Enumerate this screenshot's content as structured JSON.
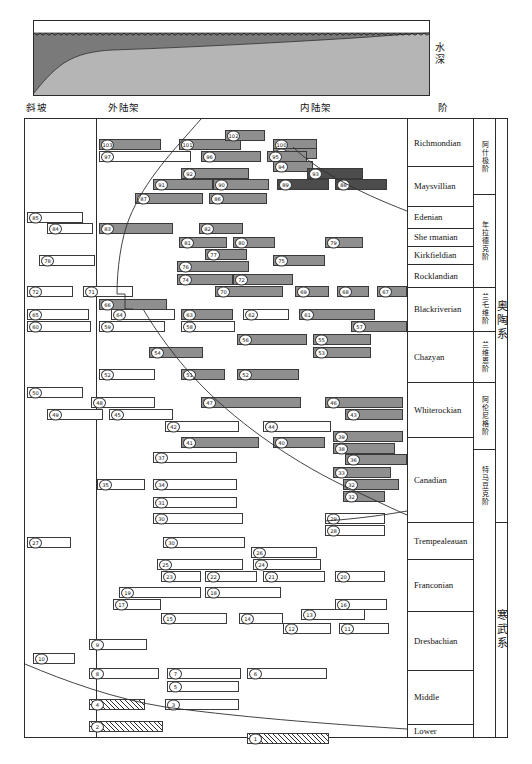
{
  "figure": {
    "title_caption": "",
    "depth_axis_label": "水深",
    "column_headers": [
      {
        "key": "slope",
        "label": "斜坡",
        "x": 26
      },
      {
        "key": "outer_shelf",
        "label": "外陆架",
        "x": 108
      },
      {
        "key": "inner_shelf",
        "label": "内陆架",
        "x": 300
      },
      {
        "key": "stage",
        "label": "阶",
        "x": 438
      }
    ]
  },
  "depth_panel": {
    "water_fill_color": "#7a7a7a",
    "sediment_fill_color": "#b5b5b5",
    "sky_color": "#ffffff",
    "wave_marker": "scalloped-waterline"
  },
  "chart_data": {
    "type": "table",
    "xlabel": "",
    "ylabel": "",
    "facies_columns": [
      "斜坡",
      "外陆架",
      "内陆架"
    ],
    "systems": [
      {
        "name": "奥陶系",
        "top": 0,
        "bottom": 403
      },
      {
        "name": "寒武系",
        "top": 403,
        "bottom": 619
      }
    ],
    "series": [
      {
        "name": "阿什极阶",
        "top": 0,
        "bottom": 75
      },
      {
        "name": "年拉德克阶",
        "top": 75,
        "bottom": 168
      },
      {
        "name": "兰乇维阶",
        "top": 168,
        "bottom": 212
      },
      {
        "name": "兰维恩阶",
        "top": 212,
        "bottom": 263
      },
      {
        "name": "阿伦尼格阶",
        "top": 263,
        "bottom": 330
      },
      {
        "name": "特马豆克阶",
        "top": 330,
        "bottom": 403
      }
    ],
    "stages": [
      {
        "label": "Richmondian",
        "top": 0,
        "bottom": 47
      },
      {
        "label": "Maysvillian",
        "top": 47,
        "bottom": 87
      },
      {
        "label": "Edenian",
        "top": 87,
        "bottom": 109
      },
      {
        "label": "She rmanian",
        "top": 109,
        "bottom": 127
      },
      {
        "label": "Kirkfieldian",
        "top": 127,
        "bottom": 145
      },
      {
        "label": "Rocklandian",
        "top": 145,
        "bottom": 168
      },
      {
        "label": "Blackriverian",
        "top": 168,
        "bottom": 212
      },
      {
        "label": "Chazyan",
        "top": 212,
        "bottom": 263
      },
      {
        "label": "Whiterockian",
        "top": 263,
        "bottom": 318
      },
      {
        "label": "Canadian",
        "top": 318,
        "bottom": 403
      },
      {
        "label": "Trempealeauan",
        "top": 403,
        "bottom": 440
      },
      {
        "label": "Franconian",
        "top": 440,
        "bottom": 492
      },
      {
        "label": "Dresbachian",
        "top": 492,
        "bottom": 551
      },
      {
        "label": "Middle",
        "top": 551,
        "bottom": 605
      },
      {
        "label": "Lower",
        "top": 605,
        "bottom": 619
      }
    ],
    "colors": {
      "open": "#ffffff",
      "grey": "#8f8f8f",
      "dark": "#4c4c4c",
      "hatch": "#2f2f2f",
      "frame": "#2b2b2b"
    },
    "bars": [
      {
        "n": "103",
        "x": 74,
        "w": 62,
        "y": 20,
        "fill": "grey"
      },
      {
        "n": "101",
        "x": 154,
        "w": 62,
        "y": 20,
        "fill": "grey"
      },
      {
        "n": "102",
        "x": 200,
        "w": 40,
        "y": 11,
        "fill": "grey"
      },
      {
        "n": "100",
        "x": 248,
        "w": 44,
        "y": 20,
        "fill": "grey"
      },
      {
        "n": "99",
        "x": 248,
        "w": 44,
        "y": 29,
        "fill": "grey"
      },
      {
        "n": "97",
        "x": 74,
        "w": 92,
        "y": 32,
        "fill": "open"
      },
      {
        "n": "96",
        "x": 176,
        "w": 60,
        "y": 32,
        "fill": "grey"
      },
      {
        "n": "95",
        "x": 242,
        "w": 40,
        "y": 32,
        "fill": "grey"
      },
      {
        "n": "94",
        "x": 248,
        "w": 40,
        "y": 42,
        "fill": "grey"
      },
      {
        "n": "92",
        "x": 156,
        "w": 68,
        "y": 49,
        "fill": "grey"
      },
      {
        "n": "93",
        "x": 282,
        "w": 56,
        "y": 49,
        "fill": "dark"
      },
      {
        "n": "91",
        "x": 128,
        "w": 60,
        "y": 60,
        "fill": "grey"
      },
      {
        "n": "90",
        "x": 188,
        "w": 56,
        "y": 60,
        "fill": "grey"
      },
      {
        "n": "89",
        "x": 252,
        "w": 52,
        "y": 60,
        "fill": "dark"
      },
      {
        "n": "88",
        "x": 310,
        "w": 52,
        "y": 60,
        "fill": "dark"
      },
      {
        "n": "87",
        "x": 110,
        "w": 68,
        "y": 74,
        "fill": "grey"
      },
      {
        "n": "86",
        "x": 184,
        "w": 58,
        "y": 74,
        "fill": "grey"
      },
      {
        "n": "85",
        "x": 2,
        "w": 56,
        "y": 93,
        "fill": "open"
      },
      {
        "n": "84",
        "x": 22,
        "w": 46,
        "y": 104,
        "fill": "open"
      },
      {
        "n": "83",
        "x": 74,
        "w": 74,
        "y": 104,
        "fill": "grey"
      },
      {
        "n": "82",
        "x": 174,
        "w": 44,
        "y": 104,
        "fill": "grey"
      },
      {
        "n": "81",
        "x": 154,
        "w": 48,
        "y": 118,
        "fill": "grey"
      },
      {
        "n": "80",
        "x": 208,
        "w": 42,
        "y": 118,
        "fill": "grey"
      },
      {
        "n": "79",
        "x": 300,
        "w": 38,
        "y": 118,
        "fill": "grey"
      },
      {
        "n": "77",
        "x": 180,
        "w": 42,
        "y": 130,
        "fill": "grey"
      },
      {
        "n": "78",
        "x": 14,
        "w": 56,
        "y": 136,
        "fill": "open"
      },
      {
        "n": "76",
        "x": 152,
        "w": 72,
        "y": 142,
        "fill": "grey"
      },
      {
        "n": "75",
        "x": 248,
        "w": 52,
        "y": 136,
        "fill": "grey"
      },
      {
        "n": "74",
        "x": 152,
        "w": 56,
        "y": 155,
        "fill": "grey"
      },
      {
        "n": "72",
        "x": 208,
        "w": 60,
        "y": 155,
        "fill": "grey"
      },
      {
        "n": "72b",
        "x": 2,
        "w": 46,
        "y": 167,
        "fill": "open"
      },
      {
        "n": "71",
        "x": 58,
        "w": 50,
        "y": 167,
        "fill": "open"
      },
      {
        "n": "70",
        "x": 190,
        "w": 68,
        "y": 167,
        "fill": "grey"
      },
      {
        "n": "69",
        "x": 270,
        "w": 34,
        "y": 167,
        "fill": "grey"
      },
      {
        "n": "68",
        "x": 312,
        "w": 32,
        "y": 167,
        "fill": "grey"
      },
      {
        "n": "67",
        "x": 352,
        "w": 30,
        "y": 167,
        "fill": "grey"
      },
      {
        "n": "66",
        "x": 74,
        "w": 68,
        "y": 180,
        "fill": "grey"
      },
      {
        "n": "65",
        "x": 2,
        "w": 62,
        "y": 190,
        "fill": "open"
      },
      {
        "n": "64",
        "x": 86,
        "w": 64,
        "y": 190,
        "fill": "open"
      },
      {
        "n": "63",
        "x": 156,
        "w": 52,
        "y": 190,
        "fill": "grey"
      },
      {
        "n": "62",
        "x": 218,
        "w": 46,
        "y": 190,
        "fill": "open"
      },
      {
        "n": "61",
        "x": 274,
        "w": 76,
        "y": 190,
        "fill": "grey"
      },
      {
        "n": "60",
        "x": 2,
        "w": 64,
        "y": 202,
        "fill": "open"
      },
      {
        "n": "59",
        "x": 74,
        "w": 66,
        "y": 202,
        "fill": "open"
      },
      {
        "n": "58",
        "x": 156,
        "w": 54,
        "y": 202,
        "fill": "open"
      },
      {
        "n": "57",
        "x": 326,
        "w": 56,
        "y": 202,
        "fill": "grey"
      },
      {
        "n": "56",
        "x": 212,
        "w": 70,
        "y": 215,
        "fill": "grey"
      },
      {
        "n": "55",
        "x": 288,
        "w": 58,
        "y": 215,
        "fill": "grey"
      },
      {
        "n": "53",
        "x": 288,
        "w": 58,
        "y": 228,
        "fill": "grey"
      },
      {
        "n": "54",
        "x": 124,
        "w": 54,
        "y": 228,
        "fill": "grey"
      },
      {
        "n": "52",
        "x": 74,
        "w": 56,
        "y": 250,
        "fill": "open"
      },
      {
        "n": "51",
        "x": 156,
        "w": 44,
        "y": 250,
        "fill": "grey"
      },
      {
        "n": "52b",
        "x": 212,
        "w": 62,
        "y": 250,
        "fill": "grey"
      },
      {
        "n": "50",
        "x": 2,
        "w": 56,
        "y": 268,
        "fill": "open"
      },
      {
        "n": "48",
        "x": 66,
        "w": 64,
        "y": 278,
        "fill": "open"
      },
      {
        "n": "47",
        "x": 176,
        "w": 100,
        "y": 278,
        "fill": "grey"
      },
      {
        "n": "46",
        "x": 300,
        "w": 78,
        "y": 278,
        "fill": "grey"
      },
      {
        "n": "49",
        "x": 22,
        "w": 56,
        "y": 290,
        "fill": "open"
      },
      {
        "n": "45",
        "x": 84,
        "w": 64,
        "y": 290,
        "fill": "open"
      },
      {
        "n": "43",
        "x": 320,
        "w": 58,
        "y": 290,
        "fill": "grey"
      },
      {
        "n": "42",
        "x": 140,
        "w": 74,
        "y": 302,
        "fill": "open"
      },
      {
        "n": "44",
        "x": 238,
        "w": 68,
        "y": 302,
        "fill": "open"
      },
      {
        "n": "41",
        "x": 156,
        "w": 78,
        "y": 318,
        "fill": "grey"
      },
      {
        "n": "40",
        "x": 248,
        "w": 52,
        "y": 318,
        "fill": "grey"
      },
      {
        "n": "39",
        "x": 308,
        "w": 70,
        "y": 312,
        "fill": "grey"
      },
      {
        "n": "38",
        "x": 308,
        "w": 62,
        "y": 324,
        "fill": "grey"
      },
      {
        "n": "37",
        "x": 128,
        "w": 84,
        "y": 333,
        "fill": "open"
      },
      {
        "n": "36",
        "x": 320,
        "w": 62,
        "y": 335,
        "fill": "grey"
      },
      {
        "n": "33",
        "x": 308,
        "w": 58,
        "y": 348,
        "fill": "grey"
      },
      {
        "n": "35",
        "x": 72,
        "w": 48,
        "y": 360,
        "fill": "open"
      },
      {
        "n": "34",
        "x": 128,
        "w": 84,
        "y": 360,
        "fill": "open"
      },
      {
        "n": "32",
        "x": 318,
        "w": 56,
        "y": 360,
        "fill": "grey"
      },
      {
        "n": "31",
        "x": 128,
        "w": 84,
        "y": 378,
        "fill": "open"
      },
      {
        "n": "32b",
        "x": 318,
        "w": 42,
        "y": 372,
        "fill": "grey"
      },
      {
        "n": "30",
        "x": 128,
        "w": 90,
        "y": 394,
        "fill": "open"
      },
      {
        "n": "29",
        "x": 300,
        "w": 60,
        "y": 394,
        "fill": "open"
      },
      {
        "n": "28",
        "x": 300,
        "w": 60,
        "y": 406,
        "fill": "open"
      },
      {
        "n": "27",
        "x": 2,
        "w": 44,
        "y": 418,
        "fill": "open"
      },
      {
        "n": "30b",
        "x": 138,
        "w": 82,
        "y": 418,
        "fill": "open"
      },
      {
        "n": "26",
        "x": 226,
        "w": 66,
        "y": 428,
        "fill": "open"
      },
      {
        "n": "25",
        "x": 132,
        "w": 86,
        "y": 440,
        "fill": "open"
      },
      {
        "n": "24",
        "x": 228,
        "w": 68,
        "y": 440,
        "fill": "open"
      },
      {
        "n": "23",
        "x": 136,
        "w": 40,
        "y": 452,
        "fill": "open"
      },
      {
        "n": "22",
        "x": 180,
        "w": 52,
        "y": 452,
        "fill": "open"
      },
      {
        "n": "21",
        "x": 238,
        "w": 62,
        "y": 452,
        "fill": "open"
      },
      {
        "n": "20",
        "x": 310,
        "w": 50,
        "y": 452,
        "fill": "open"
      },
      {
        "n": "19",
        "x": 94,
        "w": 82,
        "y": 468,
        "fill": "open"
      },
      {
        "n": "18",
        "x": 180,
        "w": 76,
        "y": 468,
        "fill": "open"
      },
      {
        "n": "17",
        "x": 88,
        "w": 48,
        "y": 480,
        "fill": "open"
      },
      {
        "n": "16",
        "x": 310,
        "w": 52,
        "y": 480,
        "fill": "open"
      },
      {
        "n": "15",
        "x": 136,
        "w": 66,
        "y": 494,
        "fill": "open"
      },
      {
        "n": "14",
        "x": 214,
        "w": 44,
        "y": 494,
        "fill": "open"
      },
      {
        "n": "13",
        "x": 276,
        "w": 64,
        "y": 490,
        "fill": "open"
      },
      {
        "n": "12",
        "x": 258,
        "w": 48,
        "y": 504,
        "fill": "open"
      },
      {
        "n": "11",
        "x": 314,
        "w": 50,
        "y": 504,
        "fill": "open"
      },
      {
        "n": "9",
        "x": 64,
        "w": 58,
        "y": 520,
        "fill": "open"
      },
      {
        "n": "10",
        "x": 8,
        "w": 42,
        "y": 534,
        "fill": "open"
      },
      {
        "n": "8",
        "x": 64,
        "w": 70,
        "y": 549,
        "fill": "open"
      },
      {
        "n": "7",
        "x": 142,
        "w": 74,
        "y": 549,
        "fill": "open"
      },
      {
        "n": "6",
        "x": 222,
        "w": 80,
        "y": 549,
        "fill": "open"
      },
      {
        "n": "5",
        "x": 142,
        "w": 72,
        "y": 562,
        "fill": "open"
      },
      {
        "n": "4",
        "x": 64,
        "w": 56,
        "y": 580,
        "fill": "hatch"
      },
      {
        "n": "3",
        "x": 140,
        "w": 74,
        "y": 580,
        "fill": "open"
      },
      {
        "n": "2",
        "x": 64,
        "w": 74,
        "y": 602,
        "fill": "hatch"
      },
      {
        "n": "1",
        "x": 222,
        "w": 82,
        "y": 614,
        "fill": "hatch"
      }
    ]
  }
}
